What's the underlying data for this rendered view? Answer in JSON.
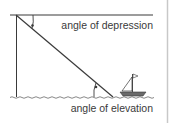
{
  "diagram": {
    "labels": {
      "depression": "angle of depression",
      "elevation": "angle of elevation"
    },
    "colors": {
      "line": "#3a3a3a",
      "text": "#3a3a3a",
      "border": "#c8c8c8",
      "background": "#ffffff"
    },
    "icons": {
      "boat": "sailboat-icon"
    }
  }
}
